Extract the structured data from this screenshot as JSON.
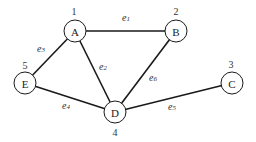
{
  "diagram": {
    "type": "undirected-graph",
    "nodes": [
      {
        "id": "A",
        "label": "A",
        "number": "1"
      },
      {
        "id": "B",
        "label": "B",
        "number": "2"
      },
      {
        "id": "C",
        "label": "C",
        "number": "3"
      },
      {
        "id": "D",
        "label": "D",
        "number": "4"
      },
      {
        "id": "E",
        "label": "E",
        "number": "5"
      }
    ],
    "edges": [
      {
        "id": "e1",
        "from": "A",
        "to": "B",
        "label": "e",
        "sub": "1"
      },
      {
        "id": "e2",
        "from": "A",
        "to": "D",
        "label": "e",
        "sub": "2"
      },
      {
        "id": "e3",
        "from": "A",
        "to": "E",
        "label": "e",
        "sub": "3"
      },
      {
        "id": "e4",
        "from": "E",
        "to": "D",
        "label": "e",
        "sub": "4"
      },
      {
        "id": "e5",
        "from": "D",
        "to": "C",
        "label": "e",
        "sub": "5"
      },
      {
        "id": "e6",
        "from": "B",
        "to": "D",
        "label": "e",
        "sub": "6"
      }
    ],
    "colors": {
      "stroke": "#1a1a1a",
      "background": "#ffffff",
      "text": "#222222"
    }
  }
}
